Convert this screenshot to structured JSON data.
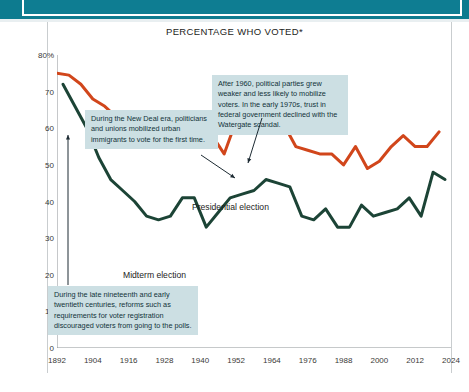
{
  "banner": {
    "title": ""
  },
  "figure": {
    "title": "PERCENTAGE WHO VOTED*"
  },
  "callouts": {
    "new_deal": "During the New Deal era, politicians and unions mobilized urban immigrants to vote for the first time.",
    "after_1960": "After 1960, political parties grew weaker and less likely to mobilize voters. In the early 1970s, trust in federal government declined with the Watergate scandal.",
    "reforms": "During the late nineteenth and early twentieth centuries, reforms such as requirements for voter registration discouraged voters from going to the polls."
  },
  "series_labels": {
    "presidential": "Presidential election",
    "midterm": "Midterm election"
  },
  "colors": {
    "presidential": "#d1461b",
    "midterm": "#1c4436",
    "banner": "#0e7d92",
    "callout_bg": "#ccdfe3",
    "axis": "#8d9295",
    "text": "#1d1d1b"
  },
  "chart_data": {
    "type": "line",
    "title": "PERCENTAGE WHO VOTED*",
    "xlabel": "",
    "ylabel": "",
    "xlim": [
      1892,
      2024
    ],
    "ylim": [
      0,
      80
    ],
    "grid": false,
    "legend": "inline-labels",
    "x_ticks": [
      1892,
      1904,
      1916,
      1928,
      1940,
      1952,
      1964,
      1976,
      1988,
      2000,
      2012,
      2024
    ],
    "y_ticks": [
      0,
      10,
      20,
      30,
      40,
      50,
      60,
      70,
      80
    ],
    "y_tick_labels": [
      "0",
      "10",
      "20",
      "30",
      "40",
      "50",
      "60",
      "70",
      "80%"
    ],
    "series": [
      {
        "name": "Presidential election",
        "color": "#d1461b",
        "x": [
          1892,
          1896,
          1900,
          1904,
          1908,
          1912,
          1916,
          1920,
          1924,
          1928,
          1932,
          1936,
          1940,
          1944,
          1948,
          1952,
          1956,
          1960,
          1964,
          1968,
          1972,
          1976,
          1980,
          1984,
          1988,
          1992,
          1996,
          2000,
          2004,
          2008,
          2012,
          2016,
          2020
        ],
        "values": [
          75,
          74.5,
          72,
          68,
          66,
          63,
          62,
          58,
          56,
          57,
          59,
          61,
          63,
          58,
          53,
          62,
          61,
          63,
          62,
          61,
          55,
          54,
          53,
          53,
          50,
          55,
          49,
          51,
          55,
          58,
          55,
          55,
          59
        ]
      },
      {
        "name": "Midterm election",
        "color": "#1c4436",
        "x": [
          1894,
          1898,
          1902,
          1906,
          1910,
          1914,
          1918,
          1922,
          1926,
          1930,
          1934,
          1938,
          1942,
          1946,
          1950,
          1954,
          1958,
          1962,
          1966,
          1970,
          1974,
          1978,
          1982,
          1986,
          1990,
          1994,
          1998,
          2002,
          2006,
          2010,
          2014,
          2018,
          2022
        ],
        "values": [
          72,
          66,
          60,
          52,
          46,
          43,
          40,
          36,
          35,
          36,
          41,
          41,
          33,
          37,
          41,
          42,
          43,
          46,
          45,
          44,
          36,
          35,
          38,
          33,
          33,
          39,
          36,
          37,
          38,
          41,
          36,
          48,
          46
        ]
      }
    ],
    "annotations": [
      {
        "text": "During the New Deal era, politicians and unions mobilized urban immigrants to vote for the first time.",
        "points_to_year": 1936
      },
      {
        "text": "After 1960, political parties grew weaker and less likely to mobilize voters. In the early 1970s, trust in federal government declined with the Watergate scandal.",
        "points_to_year": 1966
      },
      {
        "text": "During the late nineteenth and early twentieth centuries, reforms such as requirements for voter registration discouraged voters from going to the polls.",
        "points_to_year": 1896
      }
    ]
  }
}
